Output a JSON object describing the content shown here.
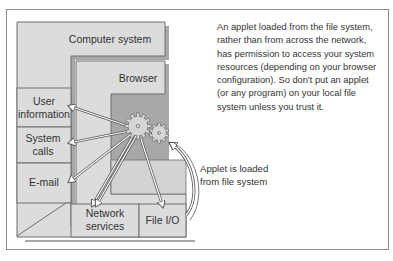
{
  "diagram": {
    "labels": {
      "computer_system": "Computer system",
      "browser": "Browser",
      "user_information": "User information",
      "system_calls": "System calls",
      "email": "E-mail",
      "network_services": "Network services",
      "file_io": "File I/O"
    },
    "annotation": "An applet loaded from the file system, rather than from across the network, has permission to access your system resources (depending on your browser configuration). So don't put an applet (or any program) on your local file system unless you trust it.",
    "arrow_caption": "Applet is loaded from file system",
    "colors": {
      "box_fill": "#dcdcdc",
      "box_stroke": "#6e6e6e",
      "shadow": "#9a9a9a",
      "text": "#333333"
    }
  }
}
